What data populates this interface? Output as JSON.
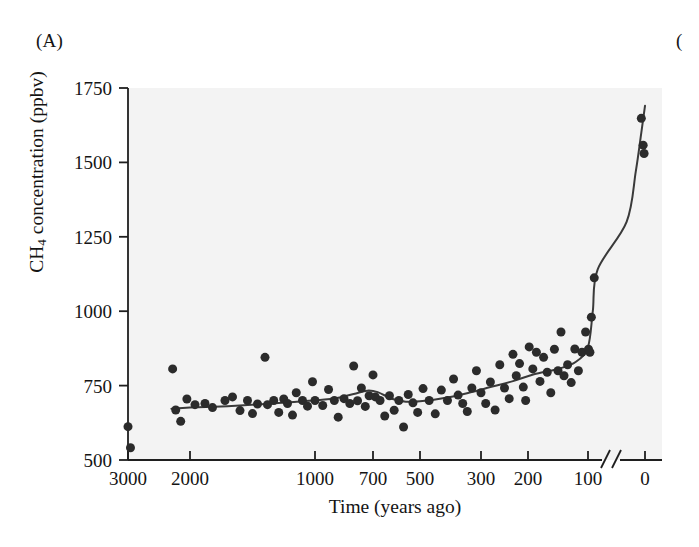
{
  "figure": {
    "panel_label": "(A)",
    "panel_label_next": "("
  },
  "chart_data": {
    "type": "scatter",
    "title": "",
    "xlabel": "Time (years ago)",
    "ylabel": "CH4 concentration (ppbv)",
    "ylabel_parts": {
      "prefix": "CH",
      "sub": "4",
      "suffix": " concentration (ppbv)"
    },
    "grid": false,
    "legend": "none",
    "axis_break": true,
    "axis_break_note": "//",
    "ylim": [
      500,
      1750
    ],
    "yticks": [
      1750,
      1500,
      1250,
      1000,
      750,
      500
    ],
    "ytick_labels": [
      "1750",
      "1500",
      "1250",
      "1000",
      "750",
      "500"
    ],
    "xticks": [
      3000,
      2000,
      1000,
      700,
      500,
      300,
      200,
      100,
      0
    ],
    "xtick_labels": [
      "3000",
      "2000",
      "1000",
      "700",
      "500",
      "300",
      "200",
      "100",
      "0"
    ],
    "x_axis_note": "Time axis is reversed (oldest at left) and non-linear, compressed toward recent years, with a break between 100 and 0 years ago.",
    "marker": {
      "shape": "circle",
      "color": "#2b2b2b",
      "size": 9
    },
    "trend_line": {
      "label": "smoothed trend",
      "color": "#3a3a3a",
      "width": 2
    },
    "plot_background": "#f3f3f3",
    "points": [
      {
        "x": 3000,
        "y": 612
      },
      {
        "x": 2960,
        "y": 541
      },
      {
        "x": 2280,
        "y": 806
      },
      {
        "x": 2230,
        "y": 668
      },
      {
        "x": 2150,
        "y": 630
      },
      {
        "x": 2050,
        "y": 705
      },
      {
        "x": 1960,
        "y": 686
      },
      {
        "x": 1880,
        "y": 690
      },
      {
        "x": 1820,
        "y": 676
      },
      {
        "x": 1720,
        "y": 700
      },
      {
        "x": 1660,
        "y": 712
      },
      {
        "x": 1600,
        "y": 666
      },
      {
        "x": 1540,
        "y": 700
      },
      {
        "x": 1500,
        "y": 656
      },
      {
        "x": 1460,
        "y": 688
      },
      {
        "x": 1400,
        "y": 845
      },
      {
        "x": 1380,
        "y": 686
      },
      {
        "x": 1330,
        "y": 700
      },
      {
        "x": 1290,
        "y": 660
      },
      {
        "x": 1250,
        "y": 705
      },
      {
        "x": 1220,
        "y": 690
      },
      {
        "x": 1180,
        "y": 651
      },
      {
        "x": 1150,
        "y": 726
      },
      {
        "x": 1100,
        "y": 700
      },
      {
        "x": 1060,
        "y": 681
      },
      {
        "x": 1020,
        "y": 763
      },
      {
        "x": 1000,
        "y": 700
      },
      {
        "x": 960,
        "y": 683
      },
      {
        "x": 930,
        "y": 737
      },
      {
        "x": 900,
        "y": 700
      },
      {
        "x": 880,
        "y": 644
      },
      {
        "x": 850,
        "y": 706
      },
      {
        "x": 820,
        "y": 690
      },
      {
        "x": 800,
        "y": 816
      },
      {
        "x": 780,
        "y": 699
      },
      {
        "x": 760,
        "y": 742
      },
      {
        "x": 740,
        "y": 680
      },
      {
        "x": 720,
        "y": 716
      },
      {
        "x": 700,
        "y": 786
      },
      {
        "x": 690,
        "y": 712
      },
      {
        "x": 670,
        "y": 700
      },
      {
        "x": 650,
        "y": 648
      },
      {
        "x": 630,
        "y": 716
      },
      {
        "x": 610,
        "y": 667
      },
      {
        "x": 590,
        "y": 700
      },
      {
        "x": 570,
        "y": 611
      },
      {
        "x": 550,
        "y": 720
      },
      {
        "x": 530,
        "y": 692
      },
      {
        "x": 510,
        "y": 660
      },
      {
        "x": 490,
        "y": 740
      },
      {
        "x": 470,
        "y": 700
      },
      {
        "x": 450,
        "y": 655
      },
      {
        "x": 430,
        "y": 735
      },
      {
        "x": 410,
        "y": 700
      },
      {
        "x": 390,
        "y": 772
      },
      {
        "x": 375,
        "y": 718
      },
      {
        "x": 360,
        "y": 690
      },
      {
        "x": 345,
        "y": 663
      },
      {
        "x": 330,
        "y": 742
      },
      {
        "x": 315,
        "y": 800
      },
      {
        "x": 300,
        "y": 726
      },
      {
        "x": 290,
        "y": 690
      },
      {
        "x": 280,
        "y": 762
      },
      {
        "x": 270,
        "y": 668
      },
      {
        "x": 260,
        "y": 820
      },
      {
        "x": 250,
        "y": 742
      },
      {
        "x": 240,
        "y": 706
      },
      {
        "x": 232,
        "y": 855
      },
      {
        "x": 225,
        "y": 783
      },
      {
        "x": 218,
        "y": 824
      },
      {
        "x": 210,
        "y": 745
      },
      {
        "x": 205,
        "y": 700
      },
      {
        "x": 198,
        "y": 880
      },
      {
        "x": 192,
        "y": 806
      },
      {
        "x": 186,
        "y": 862
      },
      {
        "x": 180,
        "y": 764
      },
      {
        "x": 174,
        "y": 845
      },
      {
        "x": 168,
        "y": 795
      },
      {
        "x": 162,
        "y": 726
      },
      {
        "x": 156,
        "y": 872
      },
      {
        "x": 150,
        "y": 800
      },
      {
        "x": 145,
        "y": 930
      },
      {
        "x": 140,
        "y": 783
      },
      {
        "x": 134,
        "y": 820
      },
      {
        "x": 128,
        "y": 760
      },
      {
        "x": 122,
        "y": 873
      },
      {
        "x": 116,
        "y": 800
      },
      {
        "x": 110,
        "y": 862
      },
      {
        "x": 104,
        "y": 930
      },
      {
        "x": 98,
        "y": 872
      },
      {
        "x": 92,
        "y": 862
      },
      {
        "x": 86,
        "y": 980
      },
      {
        "x": 74,
        "y": 1112
      },
      {
        "x": 8,
        "y": 1648
      },
      {
        "x": 4,
        "y": 1558
      },
      {
        "x": 2,
        "y": 1530
      }
    ],
    "trend_points": [
      {
        "x": 2300,
        "y": 672
      },
      {
        "x": 2000,
        "y": 676
      },
      {
        "x": 1700,
        "y": 681
      },
      {
        "x": 1400,
        "y": 688
      },
      {
        "x": 1100,
        "y": 697
      },
      {
        "x": 900,
        "y": 707
      },
      {
        "x": 800,
        "y": 722
      },
      {
        "x": 730,
        "y": 733
      },
      {
        "x": 680,
        "y": 728
      },
      {
        "x": 620,
        "y": 706
      },
      {
        "x": 560,
        "y": 696
      },
      {
        "x": 500,
        "y": 697
      },
      {
        "x": 420,
        "y": 708
      },
      {
        "x": 340,
        "y": 726
      },
      {
        "x": 280,
        "y": 745
      },
      {
        "x": 230,
        "y": 766
      },
      {
        "x": 190,
        "y": 788
      },
      {
        "x": 150,
        "y": 806
      },
      {
        "x": 120,
        "y": 830
      },
      {
        "x": 100,
        "y": 880
      },
      {
        "x": 80,
        "y": 1000
      },
      {
        "x": 60,
        "y": 1140
      },
      {
        "x": 40,
        "y": 1300
      },
      {
        "x": 20,
        "y": 1470
      },
      {
        "x": 8,
        "y": 1600
      },
      {
        "x": 0,
        "y": 1690
      }
    ]
  }
}
